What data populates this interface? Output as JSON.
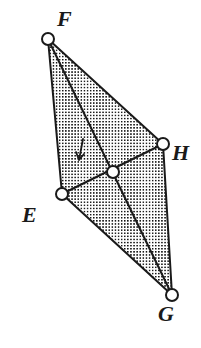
{
  "figure": {
    "name": "quadrilateral-efhg",
    "background_color": "#ffffff",
    "stroke_color": "#1a1a1a",
    "fill_pattern": "stipple-dots",
    "fill_dot_color": "#111111",
    "vertex_marker": {
      "shape": "circle",
      "radius": 6,
      "fill": "#ffffff",
      "stroke": "#1a1a1a",
      "stroke_width": 2
    }
  },
  "chart_data": {
    "type": "diagram",
    "xlim": [
      0,
      201
    ],
    "ylim": [
      0,
      348
    ],
    "grid": false,
    "points": [
      {
        "id": "F",
        "label": "F",
        "x": 48,
        "y": 39,
        "marker": "open-circle",
        "label_x": 57,
        "label_y": 8
      },
      {
        "id": "H",
        "label": "H",
        "x": 163,
        "y": 144,
        "marker": "open-circle",
        "label_x": 172,
        "label_y": 142
      },
      {
        "id": "E",
        "label": "E",
        "x": 62,
        "y": 194,
        "marker": "open-circle",
        "label_x": 22,
        "label_y": 204
      },
      {
        "id": "G",
        "label": "G",
        "x": 172,
        "y": 295,
        "marker": "open-circle",
        "label_x": 158,
        "label_y": 303
      },
      {
        "id": "P",
        "label": "",
        "x": 113,
        "y": 172,
        "marker": "open-circle",
        "label_x": 0,
        "label_y": 0
      }
    ],
    "edges": [
      {
        "from": "F",
        "to": "H",
        "kind": "side"
      },
      {
        "from": "H",
        "to": "G",
        "kind": "side"
      },
      {
        "from": "G",
        "to": "E",
        "kind": "side"
      },
      {
        "from": "E",
        "to": "F",
        "kind": "side"
      },
      {
        "from": "F",
        "to": "G",
        "kind": "diagonal"
      },
      {
        "from": "E",
        "to": "H",
        "kind": "diagonal"
      }
    ],
    "annotations": [
      {
        "id": "tick-mark",
        "type": "tick",
        "x": 80,
        "y": 150,
        "note": "short slanted tick/arrow stroke inside figure"
      }
    ]
  },
  "labels": {
    "f": "F",
    "h": "H",
    "e": "E",
    "g": "G"
  }
}
